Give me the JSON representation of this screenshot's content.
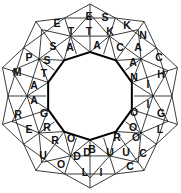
{
  "puzzle": {
    "kind": "star-word-wheel",
    "points": 10,
    "center_label": "",
    "colors": {
      "background": "#ffffff",
      "line": "#1a1a1a",
      "inner_circle_line": "#000000",
      "letter": "#111111"
    },
    "geometry": {
      "center_x": 90,
      "center_y": 96,
      "inner_circle_r": 44,
      "mid_ring_r": 63,
      "outer_ring_r": 82,
      "tip_r": 92,
      "letter_ring_inner_r": 53,
      "letter_ring_mid_r": 72,
      "letter_ring_outer_r": 86
    },
    "rings": {
      "inner_ring_label": "inner ring",
      "mid_ring_label": "middle ring",
      "outer_ring_label": "outer ring"
    },
    "letters_inner": [
      {
        "char": "A",
        "angle": -90
      },
      {
        "char": "C",
        "angle": -54
      },
      {
        "char": "A",
        "angle": -18
      },
      {
        "char": "N",
        "angle": 18
      },
      {
        "char": "I",
        "angle": 54
      },
      {
        "char": "O",
        "angle": 90
      },
      {
        "char": "O",
        "angle": 126
      },
      {
        "char": "R",
        "angle": 162
      },
      {
        "char": "G",
        "angle": 198
      },
      {
        "char": "A",
        "angle": 234
      }
    ],
    "letters_mid": [
      {
        "char": "T",
        "angle": -108
      },
      {
        "char": "T",
        "angle": -90
      },
      {
        "char": "K",
        "angle": -72
      },
      {
        "char": "K",
        "angle": -54
      },
      {
        "char": "N",
        "angle": -36
      },
      {
        "char": "A",
        "angle": -18
      },
      {
        "char": "C",
        "angle": 0
      },
      {
        "char": "H",
        "angle": 18
      },
      {
        "char": "I",
        "angle": 36
      },
      {
        "char": "G",
        "angle": 54
      },
      {
        "char": "L",
        "angle": 72
      },
      {
        "char": "O",
        "angle": 90
      },
      {
        "char": "C",
        "angle": 108
      },
      {
        "char": "U",
        "angle": 126
      },
      {
        "char": "U",
        "angle": 144
      },
      {
        "char": "D",
        "angle": 162
      },
      {
        "char": "D",
        "angle": 180
      },
      {
        "char": "O",
        "angle": 198
      },
      {
        "char": "R",
        "angle": 216
      },
      {
        "char": "R",
        "angle": 234
      },
      {
        "char": "A",
        "angle": 252
      },
      {
        "char": "A",
        "angle": 270
      },
      {
        "char": "T",
        "angle": 288
      },
      {
        "char": "S",
        "angle": 306
      },
      {
        "char": "S",
        "angle": 324
      },
      {
        "char": "A",
        "angle": 342
      }
    ],
    "letters_outer": [
      {
        "char": "E",
        "angle": -99
      },
      {
        "char": "S",
        "angle": -81
      },
      {
        "char": "K",
        "angle": -63
      },
      {
        "char": "A",
        "angle": -45
      },
      {
        "char": "C",
        "angle": -27
      },
      {
        "char": "H",
        "angle": -9
      },
      {
        "char": "I",
        "angle": 9
      },
      {
        "char": "G",
        "angle": 27
      },
      {
        "char": "L",
        "angle": 45
      },
      {
        "char": "O",
        "angle": 63
      },
      {
        "char": "C",
        "angle": 81
      },
      {
        "char": "C",
        "angle": 99
      },
      {
        "char": "U",
        "angle": 117
      },
      {
        "char": "I",
        "angle": 135
      },
      {
        "char": "L",
        "angle": 153
      },
      {
        "char": "D",
        "angle": 171
      },
      {
        "char": "O",
        "angle": 189
      },
      {
        "char": "U",
        "angle": 207
      },
      {
        "char": "E",
        "angle": 225
      },
      {
        "char": "R",
        "angle": 243
      },
      {
        "char": "M",
        "angle": 261
      },
      {
        "char": "P",
        "angle": 279
      },
      {
        "char": "T",
        "angle": 297
      },
      {
        "char": "T",
        "angle": 315
      },
      {
        "char": "E",
        "angle": 333
      },
      {
        "char": "T",
        "angle": 351
      }
    ],
    "letters_all_reading": "E S K A C H I G L O C C U I L D O U E R M P T T E T",
    "letters_placed": [
      {
        "char": "E",
        "x": 89,
        "y": 16
      },
      {
        "char": "S",
        "x": 105,
        "y": 17
      },
      {
        "char": "T",
        "x": 71,
        "y": 31
      },
      {
        "char": "T",
        "x": 89,
        "y": 31
      },
      {
        "char": "K",
        "x": 110,
        "y": 31
      },
      {
        "char": "E",
        "x": 57,
        "y": 23
      },
      {
        "char": "K",
        "x": 127,
        "y": 25
      },
      {
        "char": "N",
        "x": 143,
        "y": 35
      },
      {
        "char": "S",
        "x": 53,
        "y": 46
      },
      {
        "char": "A",
        "x": 70,
        "y": 47
      },
      {
        "char": "A",
        "x": 97,
        "y": 45
      },
      {
        "char": "C",
        "x": 120,
        "y": 47
      },
      {
        "char": "A",
        "x": 138,
        "y": 47
      },
      {
        "char": "P",
        "x": 29,
        "y": 57
      },
      {
        "char": "S",
        "x": 47,
        "y": 60
      },
      {
        "char": "A",
        "x": 133,
        "y": 62
      },
      {
        "char": "C",
        "x": 159,
        "y": 57
      },
      {
        "char": "M",
        "x": 17,
        "y": 72
      },
      {
        "char": "T",
        "x": 44,
        "y": 73
      },
      {
        "char": "N",
        "x": 134,
        "y": 77
      },
      {
        "char": "H",
        "x": 161,
        "y": 74
      },
      {
        "char": "A",
        "x": 34,
        "y": 85
      },
      {
        "char": "I",
        "x": 148,
        "y": 84
      },
      {
        "char": "A",
        "x": 34,
        "y": 100
      },
      {
        "char": "I",
        "x": 148,
        "y": 104
      },
      {
        "char": "R",
        "x": 18,
        "y": 114
      },
      {
        "char": "G",
        "x": 44,
        "y": 113
      },
      {
        "char": "O",
        "x": 134,
        "y": 112
      },
      {
        "char": "G",
        "x": 161,
        "y": 113
      },
      {
        "char": "E",
        "x": 29,
        "y": 129
      },
      {
        "char": "R",
        "x": 47,
        "y": 127
      },
      {
        "char": "O",
        "x": 133,
        "y": 127
      },
      {
        "char": "L",
        "x": 160,
        "y": 129
      },
      {
        "char": "R",
        "x": 55,
        "y": 140
      },
      {
        "char": "O",
        "x": 71,
        "y": 138
      },
      {
        "char": "R",
        "x": 117,
        "y": 137
      },
      {
        "char": "O",
        "x": 136,
        "y": 137
      },
      {
        "char": "U",
        "x": 43,
        "y": 155
      },
      {
        "char": "D",
        "x": 87,
        "y": 152
      },
      {
        "char": "B",
        "x": 92,
        "y": 149
      },
      {
        "char": "U",
        "x": 110,
        "y": 152
      },
      {
        "char": "U",
        "x": 126,
        "y": 152
      },
      {
        "char": "C",
        "x": 143,
        "y": 153
      },
      {
        "char": "O",
        "x": 61,
        "y": 164
      },
      {
        "char": "D",
        "x": 77,
        "y": 156
      },
      {
        "char": "C",
        "x": 130,
        "y": 166
      },
      {
        "char": "L",
        "x": 85,
        "y": 172
      },
      {
        "char": "I",
        "x": 101,
        "y": 172
      }
    ]
  }
}
